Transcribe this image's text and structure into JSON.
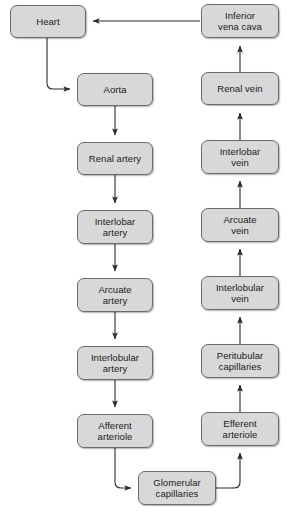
{
  "diagram": {
    "style": {
      "node_fill": "#d8d8d8",
      "node_border": "#6b6b6b",
      "edge_color": "#2b2b2b",
      "background": "#ffffff",
      "text_color": "#1b1b1b"
    },
    "nodes": [
      {
        "id": "heart",
        "label": "Heart",
        "x": 10,
        "y": 5,
        "w": 76,
        "h": 33
      },
      {
        "id": "inferior-vena-cava",
        "label": "Inferior\nvena cava",
        "x": 201,
        "y": 4,
        "w": 78,
        "h": 34
      },
      {
        "id": "aorta",
        "label": "Aorta",
        "x": 77,
        "y": 73,
        "w": 76,
        "h": 33
      },
      {
        "id": "renal-vein",
        "label": "Renal vein",
        "x": 201,
        "y": 72,
        "w": 78,
        "h": 33
      },
      {
        "id": "renal-artery",
        "label": "Renal artery",
        "x": 77,
        "y": 142,
        "w": 76,
        "h": 33
      },
      {
        "id": "interlobar-vein",
        "label": "Interlobar\nvein",
        "x": 201,
        "y": 140,
        "w": 78,
        "h": 34
      },
      {
        "id": "interlobar-artery",
        "label": "Interlobar\nartery",
        "x": 77,
        "y": 210,
        "w": 76,
        "h": 34
      },
      {
        "id": "arcuate-vein",
        "label": "Arcuate\nvein",
        "x": 201,
        "y": 208,
        "w": 78,
        "h": 34
      },
      {
        "id": "arcuate-artery",
        "label": "Arcuate\nartery",
        "x": 77,
        "y": 278,
        "w": 76,
        "h": 34
      },
      {
        "id": "interlobular-vein",
        "label": "Interlobular\nvein",
        "x": 201,
        "y": 276,
        "w": 78,
        "h": 34
      },
      {
        "id": "interlobular-artery",
        "label": "Interlobular\nartery",
        "x": 77,
        "y": 346,
        "w": 76,
        "h": 34
      },
      {
        "id": "peritubular-capillaries",
        "label": "Peritubular\ncapillaries",
        "x": 201,
        "y": 344,
        "w": 78,
        "h": 34
      },
      {
        "id": "afferent-arteriole",
        "label": "Afferent\narteriole",
        "x": 77,
        "y": 414,
        "w": 76,
        "h": 34
      },
      {
        "id": "efferent-arteriole",
        "label": "Efferent\narteriole",
        "x": 201,
        "y": 412,
        "w": 78,
        "h": 34
      },
      {
        "id": "glomerular-capillaries",
        "label": "Glomerular\ncapillaries",
        "x": 138,
        "y": 471,
        "w": 78,
        "h": 34
      }
    ],
    "edges": [
      {
        "id": "ivc-to-heart",
        "from": "inferior-vena-cava",
        "to": "heart",
        "kind": "horizontal-left"
      },
      {
        "id": "heart-to-aorta",
        "from": "heart",
        "to": "aorta",
        "kind": "elbow-down-right"
      },
      {
        "id": "aorta-to-renal-artery",
        "from": "aorta",
        "to": "renal-artery",
        "kind": "vertical-down"
      },
      {
        "id": "renal-artery-to-interlobar-artery",
        "from": "renal-artery",
        "to": "interlobar-artery",
        "kind": "vertical-down"
      },
      {
        "id": "interlobar-artery-to-arcuate-artery",
        "from": "interlobar-artery",
        "to": "arcuate-artery",
        "kind": "vertical-down"
      },
      {
        "id": "arcuate-artery-to-interlobular-artery",
        "from": "arcuate-artery",
        "to": "interlobular-artery",
        "kind": "vertical-down"
      },
      {
        "id": "interlobular-artery-to-afferent-arteriole",
        "from": "interlobular-artery",
        "to": "afferent-arteriole",
        "kind": "vertical-down"
      },
      {
        "id": "afferent-arteriole-to-glomerular",
        "from": "afferent-arteriole",
        "to": "glomerular-capillaries",
        "kind": "elbow-down-right"
      },
      {
        "id": "glomerular-to-efferent-arteriole",
        "from": "glomerular-capillaries",
        "to": "efferent-arteriole",
        "kind": "elbow-right-up"
      },
      {
        "id": "efferent-arteriole-to-peritubular",
        "from": "efferent-arteriole",
        "to": "peritubular-capillaries",
        "kind": "vertical-up"
      },
      {
        "id": "peritubular-to-interlobular-vein",
        "from": "peritubular-capillaries",
        "to": "interlobular-vein",
        "kind": "vertical-up"
      },
      {
        "id": "interlobular-vein-to-arcuate-vein",
        "from": "interlobular-vein",
        "to": "arcuate-vein",
        "kind": "vertical-up"
      },
      {
        "id": "arcuate-vein-to-interlobar-vein",
        "from": "arcuate-vein",
        "to": "interlobar-vein",
        "kind": "vertical-up"
      },
      {
        "id": "interlobar-vein-to-renal-vein",
        "from": "interlobar-vein",
        "to": "renal-vein",
        "kind": "vertical-up"
      },
      {
        "id": "renal-vein-to-ivc",
        "from": "renal-vein",
        "to": "inferior-vena-cava",
        "kind": "vertical-up"
      }
    ]
  }
}
